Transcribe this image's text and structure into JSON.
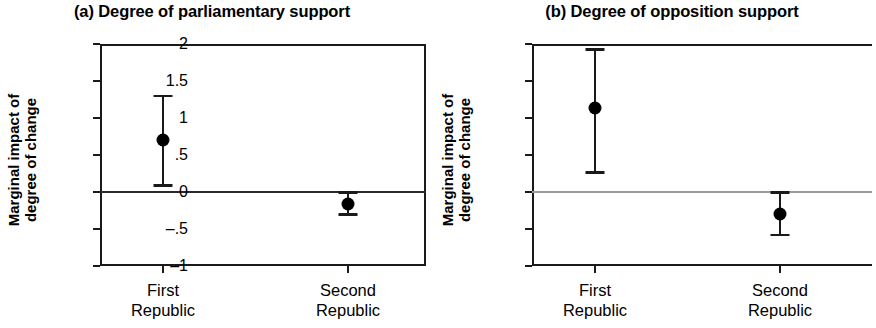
{
  "figure": {
    "background": "#ffffff",
    "ink_color": "#000000"
  },
  "panels": [
    {
      "id": "a",
      "title": "(a) Degree of parliamentary support",
      "ylabel_line1": "Marginal impact of",
      "ylabel_line2": "degree of change"
    },
    {
      "id": "b",
      "title": "(b) Degree of opposition support",
      "ylabel_line1": "Marginal impact of",
      "ylabel_line2": "degree of change"
    }
  ],
  "axis": {
    "ytick_labels": [
      "2",
      "1.5",
      "1",
      ".5",
      "0",
      "–.5",
      "–1"
    ],
    "ytick_values": [
      2,
      1.5,
      1,
      0.5,
      0,
      -0.5,
      -1
    ],
    "xtick_labels": [
      {
        "line1": "First",
        "line2": "Republic"
      },
      {
        "line1": "Second",
        "line2": "Republic"
      }
    ]
  },
  "chart_data": [
    {
      "type": "scatter",
      "title": "(a) Degree of parliamentary support",
      "xlabel": "",
      "ylabel": "Marginal impact of degree of change",
      "ylim": [
        -1,
        2
      ],
      "yticks": [
        2,
        1.5,
        1,
        0.5,
        0,
        -0.5,
        -1
      ],
      "ytick_labels": [
        "2",
        "1.5",
        "1",
        ".5",
        "0",
        "–.5",
        "–1"
      ],
      "grid": false,
      "legend": "none",
      "reference_line": {
        "y": 0,
        "color": "#2a2a2a"
      },
      "categories": [
        "First Republic",
        "Second Republic"
      ],
      "series": [
        {
          "name": "Marginal effect",
          "marker": "filled-circle",
          "values": [
            0.7,
            -0.16
          ],
          "ci_low": [
            0.09,
            -0.3
          ],
          "ci_high": [
            1.3,
            0.0
          ]
        }
      ]
    },
    {
      "type": "scatter",
      "title": "(b) Degree of opposition support",
      "xlabel": "",
      "ylabel": "Marginal impact of degree of change",
      "ylim": [
        -1,
        2
      ],
      "yticks": [
        2,
        1.5,
        1,
        0.5,
        0,
        -0.5,
        -1
      ],
      "ytick_labels": [
        "2",
        "1.5",
        "1",
        ".5",
        "0",
        "–.5",
        "–1"
      ],
      "grid": false,
      "legend": "none",
      "reference_line": {
        "y": 0,
        "color": "#9a9a9a"
      },
      "categories": [
        "First Republic",
        "Second Republic"
      ],
      "series": [
        {
          "name": "Marginal effect",
          "marker": "filled-circle",
          "values": [
            1.14,
            -0.3
          ],
          "ci_low": [
            0.27,
            -0.58
          ],
          "ci_high": [
            1.93,
            0.0
          ]
        }
      ]
    }
  ]
}
